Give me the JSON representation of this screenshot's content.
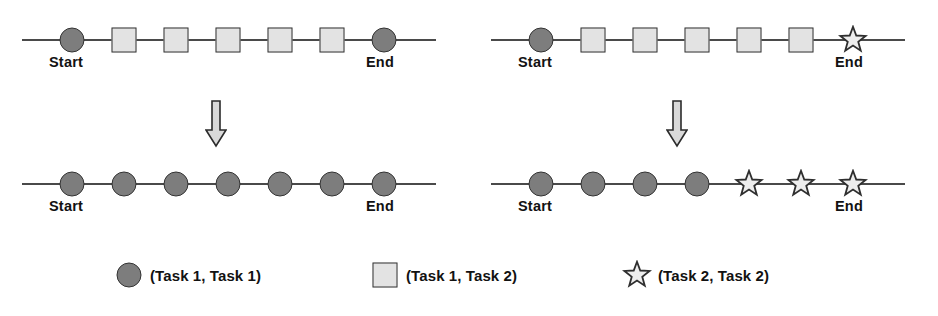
{
  "figure": {
    "panels": [
      {
        "name": "left-panel",
        "rows": [
          {
            "name": "top-row",
            "start_label": "Start",
            "end_label": "End",
            "nodes": [
              {
                "shape": "circle",
                "x": 72
              },
              {
                "shape": "square",
                "x": 124
              },
              {
                "shape": "square",
                "x": 176
              },
              {
                "shape": "square",
                "x": 228
              },
              {
                "shape": "square",
                "x": 280
              },
              {
                "shape": "square",
                "x": 332
              },
              {
                "shape": "circle",
                "x": 384
              }
            ]
          },
          {
            "name": "bottom-row",
            "start_label": "Start",
            "end_label": "End",
            "nodes": [
              {
                "shape": "circle",
                "x": 72
              },
              {
                "shape": "circle",
                "x": 124
              },
              {
                "shape": "circle",
                "x": 176
              },
              {
                "shape": "circle",
                "x": 228
              },
              {
                "shape": "circle",
                "x": 280
              },
              {
                "shape": "circle",
                "x": 332
              },
              {
                "shape": "circle",
                "x": 384
              }
            ]
          }
        ]
      },
      {
        "name": "right-panel",
        "rows": [
          {
            "name": "top-row",
            "start_label": "Start",
            "end_label": "End",
            "nodes": [
              {
                "shape": "circle",
                "x": 72
              },
              {
                "shape": "square",
                "x": 124
              },
              {
                "shape": "square",
                "x": 176
              },
              {
                "shape": "square",
                "x": 228
              },
              {
                "shape": "square",
                "x": 280
              },
              {
                "shape": "square",
                "x": 332
              },
              {
                "shape": "star",
                "x": 384
              }
            ]
          },
          {
            "name": "bottom-row",
            "start_label": "Start",
            "end_label": "End",
            "nodes": [
              {
                "shape": "circle",
                "x": 72
              },
              {
                "shape": "circle",
                "x": 124
              },
              {
                "shape": "circle",
                "x": 176
              },
              {
                "shape": "circle",
                "x": 228
              },
              {
                "shape": "star",
                "x": 280
              },
              {
                "shape": "star",
                "x": 332
              },
              {
                "shape": "star",
                "x": 384
              }
            ]
          }
        ]
      }
    ],
    "arrow_icon": "down-arrow-icon"
  },
  "legend": {
    "items": [
      {
        "marker": "circle",
        "label": "(Task 1, Task 1)"
      },
      {
        "marker": "square",
        "label": "(Task 1, Task 2)"
      },
      {
        "marker": "star",
        "label": "(Task 2, Task 2)"
      }
    ]
  },
  "colors": {
    "circle_fill": "#7d7d7d",
    "square_fill": "#e3e3e3",
    "star_fill": "#ededed",
    "outline": "#333333",
    "axis_line": "#4a4a4a",
    "text": "#121212",
    "arrow_fill": "#d9d9d9",
    "background": "#ffffff"
  }
}
